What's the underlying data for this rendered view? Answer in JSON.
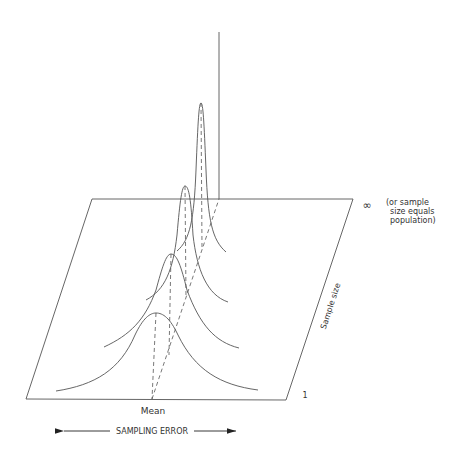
{
  "diagram": {
    "labels": {
      "mean": "Mean",
      "sampling_error": "SAMPLING ERROR",
      "sample_size": "Sample size",
      "infinity_symbol": "∞",
      "infinity_note_line1": "(or sample",
      "infinity_note_line2": "size equals",
      "infinity_note_line3": "population)",
      "one": "1"
    },
    "colors": {
      "line": "#555555",
      "text": "#333333",
      "background": "#ffffff"
    },
    "plane": {
      "corners": [
        [
          26,
          399
        ],
        [
          286,
          400
        ],
        [
          353,
          199
        ],
        [
          92,
          199
        ]
      ]
    },
    "curves": [
      {
        "name": "sample-size-1",
        "peak": [
          156,
          313
        ],
        "left_tail": [
          56,
          391
        ],
        "right_tail": [
          258,
          390
        ],
        "base": [
          152,
          399
        ]
      },
      {
        "name": "sample-size-2",
        "peak": [
          171,
          254
        ],
        "left_tail": [
          104,
          347
        ],
        "right_tail": [
          239,
          348
        ],
        "base": [
          169,
          355
        ]
      },
      {
        "name": "sample-size-3",
        "peak": [
          185,
          186
        ],
        "left_tail": [
          146,
          300
        ],
        "right_tail": [
          228,
          302
        ],
        "base": [
          186,
          297
        ]
      },
      {
        "name": "sample-size-4",
        "peak": [
          201,
          103
        ],
        "left_tail": [
          177,
          251
        ],
        "right_tail": [
          226,
          252
        ],
        "base": [
          202,
          248
        ]
      }
    ],
    "population_line": {
      "top": [
        219,
        32
      ],
      "bottom": [
        219,
        199
      ]
    }
  }
}
